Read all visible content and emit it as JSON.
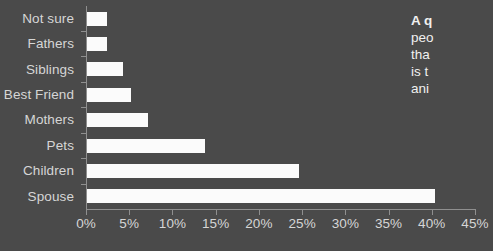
{
  "chart_data": {
    "type": "bar",
    "orientation": "horizontal",
    "title": "",
    "xlabel": "",
    "ylabel": "",
    "categories": [
      "Not sure",
      "Fathers",
      "Siblings",
      "Best Friend",
      "Mothers",
      "Pets",
      "Children",
      "Spouse"
    ],
    "values": [
      2.3,
      2.3,
      4.2,
      5.1,
      7.0,
      13.6,
      24.5,
      40.3
    ],
    "xlim": [
      0,
      45
    ],
    "xticks": [
      0,
      5,
      10,
      15,
      20,
      25,
      30,
      35,
      40,
      45
    ],
    "xticklabels": [
      "0%",
      "5%",
      "10%",
      "15%",
      "20%",
      "25%",
      "30%",
      "35%",
      "40%",
      "45%"
    ],
    "grid": false,
    "legend": null,
    "bar_color": "#fbfbfb",
    "background_color": "#4a4a4a",
    "text_color": "#d6d6d6",
    "axis_color": "#8f8f8f"
  },
  "caption": {
    "lines": [
      "A q",
      "peo",
      "tha",
      "is t",
      "ani"
    ]
  }
}
